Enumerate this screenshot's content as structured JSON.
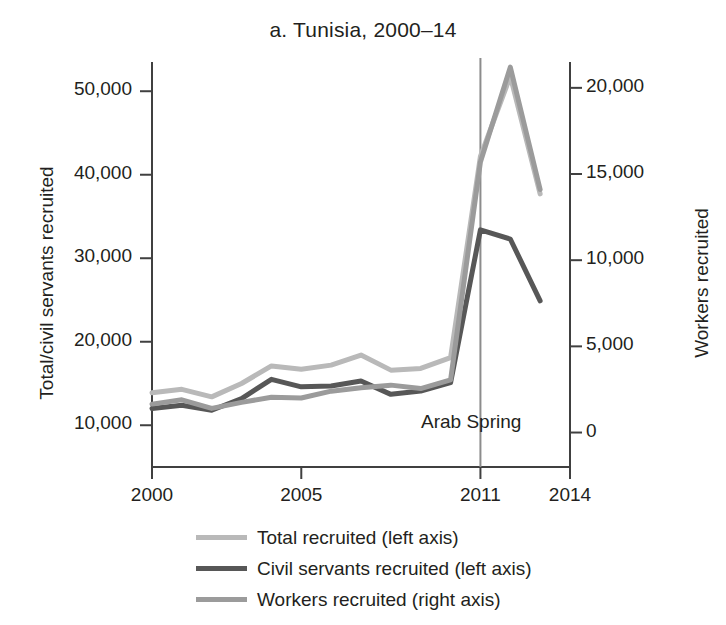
{
  "chart_data": {
    "type": "line",
    "title": "a. Tunisia, 2000–14",
    "xlabel": "",
    "ylabel": "Total/civil servants recruited",
    "y2label": "Workers recruited",
    "xlim": [
      2000,
      2014
    ],
    "ylim": [
      5000,
      53500
    ],
    "y2lim": [
      -2000,
      21500
    ],
    "grid": false,
    "legend_position": "bottom",
    "xticks": [
      "2000",
      "2005",
      "2011",
      "2014"
    ],
    "xtick_values": [
      2000,
      2005,
      2011,
      2014
    ],
    "yticks": [
      "10,000",
      "20,000",
      "30,000",
      "40,000",
      "50,000"
    ],
    "ytick_values": [
      10000,
      20000,
      30000,
      40000,
      50000
    ],
    "y2ticks": [
      "0",
      "5,000",
      "10,000",
      "15,000",
      "20,000"
    ],
    "y2tick_values": [
      0,
      5000,
      10000,
      15000,
      20000
    ],
    "x": [
      2000,
      2001,
      2002,
      2003,
      2004,
      2005,
      2006,
      2007,
      2008,
      2009,
      2010,
      2011,
      2012,
      2013
    ],
    "series": [
      {
        "name": "Total recruited (left axis)",
        "axis": "left",
        "color": "#b9b9b9",
        "width": 5,
        "values": [
          13900,
          14300,
          13400,
          15000,
          17100,
          16700,
          17200,
          18400,
          16600,
          16800,
          18100,
          42200,
          51800,
          37700
        ]
      },
      {
        "name": "Civil servants recruited (left axis)",
        "axis": "left",
        "color": "#575757",
        "width": 5,
        "values": [
          12000,
          12400,
          11800,
          13200,
          15500,
          14600,
          14700,
          15300,
          13700,
          14100,
          15100,
          33400,
          32300,
          24900
        ]
      },
      {
        "name": "Workers recruited (right axis)",
        "axis": "right",
        "color": "#9b9b9b",
        "width": 5,
        "values": [
          1650,
          1900,
          1400,
          1750,
          2050,
          2000,
          2400,
          2600,
          2750,
          2550,
          3050,
          15700,
          21200,
          14100
        ]
      }
    ],
    "annotations": [
      {
        "name": "arab-spring",
        "label": "Arab Spring",
        "x": 2011,
        "type": "vline",
        "color": "#8c8c8c"
      }
    ]
  }
}
